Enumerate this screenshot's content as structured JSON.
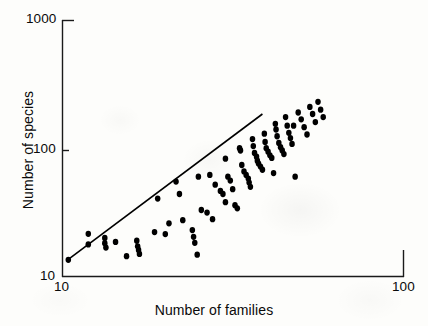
{
  "figure": {
    "background_color": "#fdfdfb",
    "ink_color": "#000000"
  },
  "axes": {
    "x_title": "Number of families",
    "y_title": "Number of species",
    "x_ticks": [
      "10",
      "100"
    ],
    "y_ticks": [
      "10",
      "100",
      "1000"
    ],
    "x_tick_10": "10",
    "x_tick_100": "100",
    "y_tick_10": "10",
    "y_tick_100": "100",
    "y_tick_1000": "1000"
  },
  "chart_data": {
    "type": "scatter",
    "title": "",
    "subtitle": "",
    "xlabel": "Number of families",
    "ylabel": "Number of species",
    "xscale": "log",
    "yscale": "log",
    "xlim": [
      10,
      100
    ],
    "ylim": [
      10,
      1000
    ],
    "xticks": [
      10,
      100
    ],
    "yticks": [
      10,
      100,
      1000
    ],
    "grid": false,
    "legend": null,
    "marker": {
      "shape": "circle",
      "filled": true,
      "color": "#000000",
      "size_px": 6
    },
    "annotations": [],
    "series": [
      {
        "name": "regression line",
        "type": "line",
        "color": "#000000",
        "linewidth_px": 1.6,
        "x": [
          10.4,
          38.5
        ],
        "y": [
          13.6,
          185.0
        ]
      },
      {
        "name": "species vs families",
        "type": "scatter",
        "points": [
          [
            10.4,
            13.5
          ],
          [
            11.9,
            21.5
          ],
          [
            11.9,
            17.8
          ],
          [
            13.3,
            20.0
          ],
          [
            13.3,
            18.2
          ],
          [
            13.4,
            16.8
          ],
          [
            14.3,
            18.6
          ],
          [
            15.4,
            14.4
          ],
          [
            16.5,
            19.0
          ],
          [
            16.6,
            17.2
          ],
          [
            16.7,
            16.1
          ],
          [
            16.8,
            15.0
          ],
          [
            18.6,
            22.2
          ],
          [
            20.0,
            21.4
          ],
          [
            19.0,
            40.5
          ],
          [
            21.5,
            55.0
          ],
          [
            22.0,
            44.0
          ],
          [
            24.0,
            23.0
          ],
          [
            24.2,
            20.4
          ],
          [
            24.4,
            18.3
          ],
          [
            24.8,
            14.8
          ],
          [
            25.5,
            33.0
          ],
          [
            26.5,
            31.5
          ],
          [
            27.0,
            62.0
          ],
          [
            28.0,
            52.0
          ],
          [
            29.0,
            46.5
          ],
          [
            29.5,
            44.0
          ],
          [
            30.0,
            83.0
          ],
          [
            30.5,
            60.0
          ],
          [
            31.0,
            56.0
          ],
          [
            31.5,
            48.0
          ],
          [
            32.0,
            36.0
          ],
          [
            32.5,
            34.0
          ],
          [
            33.0,
            100.0
          ],
          [
            33.2,
            96.0
          ],
          [
            33.5,
            74.0
          ],
          [
            34.0,
            66.0
          ],
          [
            34.5,
            62.0
          ],
          [
            35.0,
            58.0
          ],
          [
            35.2,
            54.0
          ],
          [
            35.5,
            50.0
          ],
          [
            36.0,
            118.0
          ],
          [
            36.2,
            104.0
          ],
          [
            36.5,
            92.0
          ],
          [
            37.0,
            86.0
          ],
          [
            37.2,
            80.0
          ],
          [
            37.5,
            76.0
          ],
          [
            38.0,
            72.0
          ],
          [
            38.5,
            68.0
          ],
          [
            39.0,
            130.0
          ],
          [
            39.2,
            112.0
          ],
          [
            39.5,
            100.0
          ],
          [
            40.0,
            94.0
          ],
          [
            40.5,
            88.0
          ],
          [
            41.0,
            84.0
          ],
          [
            41.5,
            64.0
          ],
          [
            42.0,
            155.0
          ],
          [
            42.2,
            140.0
          ],
          [
            42.5,
            124.0
          ],
          [
            43.0,
            110.0
          ],
          [
            43.5,
            102.0
          ],
          [
            44.0,
            96.0
          ],
          [
            44.5,
            90.0
          ],
          [
            45.0,
            175.0
          ],
          [
            45.5,
            150.0
          ],
          [
            46.0,
            132.0
          ],
          [
            46.5,
            120.0
          ],
          [
            47.0,
            108.0
          ],
          [
            48.0,
            60.0
          ],
          [
            49.0,
            190.0
          ],
          [
            50.0,
            168.0
          ],
          [
            51.0,
            146.0
          ],
          [
            52.0,
            128.0
          ],
          [
            53.0,
            210.0
          ],
          [
            54.0,
            185.0
          ],
          [
            55.0,
            160.0
          ],
          [
            56.0,
            230.0
          ],
          [
            57.0,
            200.0
          ],
          [
            58.0,
            175.0
          ],
          [
            30.0,
            38.0
          ],
          [
            27.5,
            28.0
          ],
          [
            22.5,
            27.5
          ],
          [
            20.5,
            26.0
          ],
          [
            25.0,
            60.0
          ],
          [
            47.5,
            150.0
          ]
        ]
      }
    ]
  }
}
